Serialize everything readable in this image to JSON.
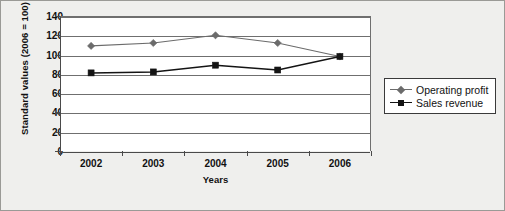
{
  "chart_data": {
    "type": "line",
    "title": "",
    "xlabel": "Years",
    "ylabel": "Standard values (2006 = 100)",
    "categories": [
      "2002",
      "2003",
      "2004",
      "2005",
      "2006"
    ],
    "ylim": [
      0,
      140
    ],
    "yticks": [
      0,
      20,
      40,
      60,
      80,
      100,
      120,
      140
    ],
    "grid": true,
    "legend_position": "right",
    "series": [
      {
        "name": "Operating profit",
        "values": [
          109,
          112,
          120,
          112,
          98
        ],
        "color": "#6b6b6b",
        "marker": "diamond"
      },
      {
        "name": "Sales revenue",
        "values": [
          81,
          82,
          89,
          84,
          98
        ],
        "color": "#141414",
        "marker": "square"
      }
    ]
  },
  "axes": {
    "y_tick_labels": [
      "140",
      "120",
      "100",
      "80",
      "60",
      "40",
      "20",
      "0"
    ],
    "x_tick_labels": [
      "2002",
      "2003",
      "2004",
      "2005",
      "2006"
    ],
    "y_title": "Standard values (2006 = 100)",
    "x_title": "Years"
  },
  "legend": {
    "entries": [
      {
        "label": "Operating profit"
      },
      {
        "label": "Sales revenue"
      }
    ]
  },
  "colors": {
    "operating_profit": "#6b6b6b",
    "sales_revenue": "#141414",
    "background": "#efefed",
    "plot_background": "#ffffff",
    "gridline": "#6f6f6f",
    "axis": "#4a4a4a"
  }
}
